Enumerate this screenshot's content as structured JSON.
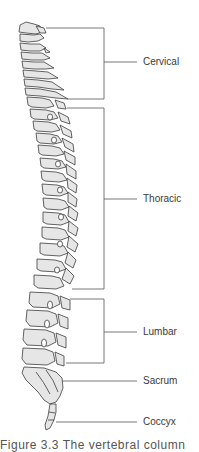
{
  "diagram": {
    "regions": [
      {
        "label": "Cervical",
        "bracket_top": 28,
        "bracket_bottom": 99,
        "label_y": 62
      },
      {
        "label": "Thoracic",
        "bracket_top": 108,
        "bracket_bottom": 289,
        "label_y": 199
      },
      {
        "label": "Lumbar",
        "bracket_top": 299,
        "bracket_bottom": 363,
        "label_y": 332
      },
      {
        "label": "Sacrum",
        "pointer_y": 381
      },
      {
        "label": "Coccyx",
        "pointer_y": 422
      }
    ],
    "caption": "Figure 3.3  The vertebral column"
  },
  "colors": {
    "bone_fill": "#e6e6e6",
    "bone_stroke": "#3c3c3c",
    "leader_line": "#555555",
    "text": "#3a3a3a"
  }
}
